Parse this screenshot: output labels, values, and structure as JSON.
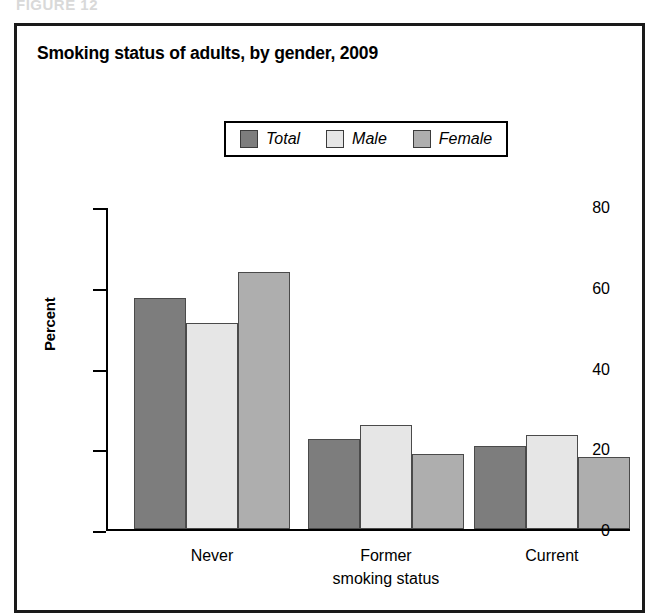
{
  "figure_caption": "FIGURE 12",
  "panel": {
    "title": "Smoking status of adults, by gender, 2009"
  },
  "colors": {
    "total": "#7d7d7d",
    "male": "#e6e6e6",
    "female": "#aeaeae",
    "bar_outline": "#4a4a4a",
    "axis": "#000000",
    "frame": "#1a1a1a",
    "background": "#ffffff"
  },
  "legend": {
    "position": "top-center",
    "entries": [
      {
        "label": "Total",
        "color": "#7d7d7d",
        "swatch": "legend-swatch-total"
      },
      {
        "label": "Male",
        "color": "#e6e6e6",
        "swatch": "legend-swatch-male"
      },
      {
        "label": "Female",
        "color": "#aeaeae",
        "swatch": "legend-swatch-female"
      }
    ]
  },
  "chart_data": {
    "type": "bar",
    "title": "Smoking status of adults, by gender, 2009",
    "subtitle": "",
    "xlabel": "smoking status",
    "ylabel": "Percent",
    "ylim": [
      0,
      80
    ],
    "yticks": [
      0,
      20,
      40,
      60,
      80
    ],
    "ytick_labels": [
      "0",
      "20",
      "40",
      "60",
      "80"
    ],
    "grid": false,
    "legend_position": "top-center",
    "categories": [
      "Never",
      "Former",
      "Current"
    ],
    "series": [
      {
        "name": "Total",
        "color": "#7d7d7d",
        "values": [
          57.3,
          22.2,
          20.6
        ]
      },
      {
        "name": "Male",
        "color": "#e6e6e6",
        "values": [
          51.0,
          25.8,
          23.4
        ]
      },
      {
        "name": "Female",
        "color": "#aeaeae",
        "values": [
          63.7,
          18.5,
          17.9
        ]
      }
    ],
    "annotations": []
  }
}
